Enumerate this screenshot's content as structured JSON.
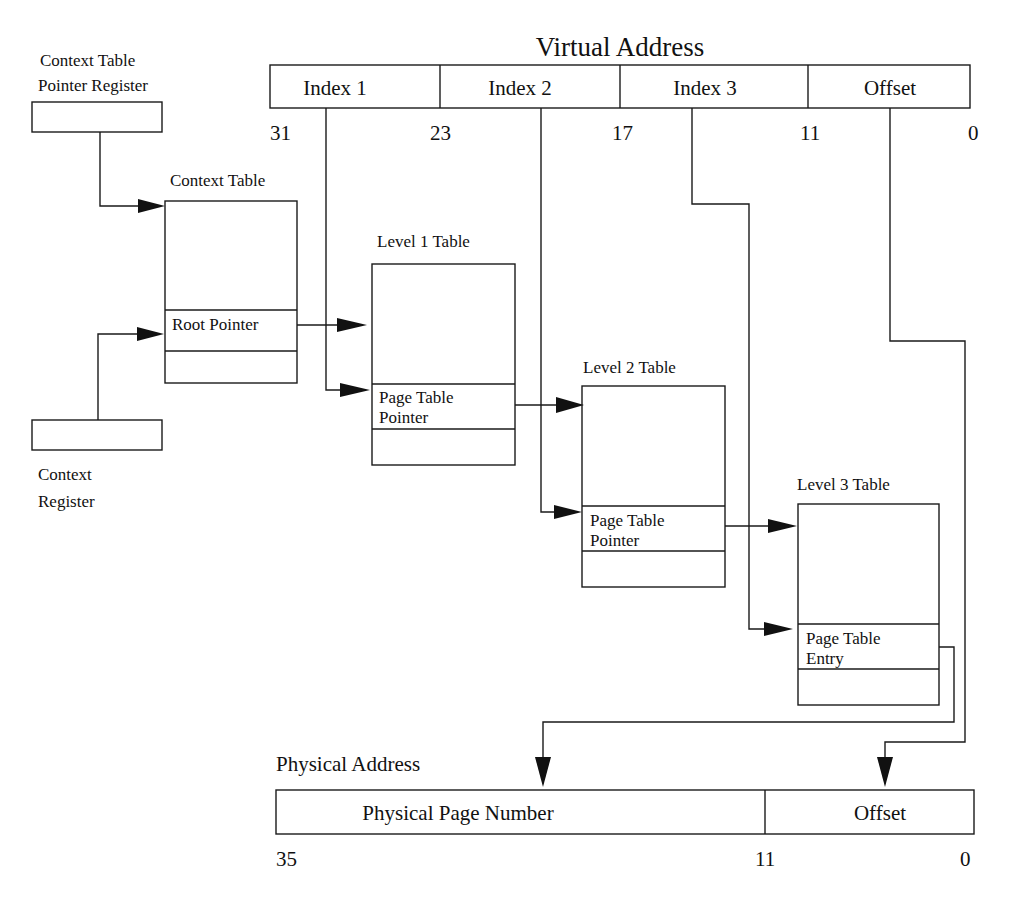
{
  "virtual_address": {
    "title": "Virtual Address",
    "fields": [
      "Index 1",
      "Index 2",
      "Index 3",
      "Offset"
    ],
    "bits": [
      "31",
      "23",
      "17",
      "11",
      "0"
    ]
  },
  "registers": {
    "context_table_pointer": {
      "line1": "Context Table",
      "line2": "Pointer Register"
    },
    "context": {
      "line1": "Context",
      "line2": "Register"
    }
  },
  "tables": {
    "context": {
      "title": "Context Table",
      "entry": "Root Pointer"
    },
    "level1": {
      "title": "Level 1 Table",
      "entry_line1": "Page Table",
      "entry_line2": "Pointer"
    },
    "level2": {
      "title": "Level 2 Table",
      "entry_line1": "Page Table",
      "entry_line2": "Pointer"
    },
    "level3": {
      "title": "Level 3 Table",
      "entry_line1": "Page Table",
      "entry_line2": "Entry"
    }
  },
  "physical_address": {
    "title": "Physical Address",
    "fields": [
      "Physical Page Number",
      "Offset"
    ],
    "bits": [
      "35",
      "11",
      "0"
    ]
  },
  "colors": {
    "line": "#1a1a1a",
    "background": "#ffffff"
  }
}
